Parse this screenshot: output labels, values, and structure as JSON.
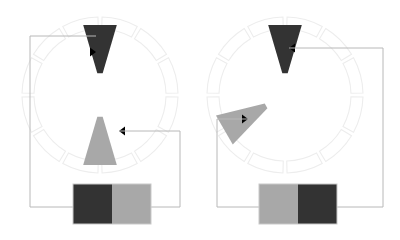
{
  "figure": {
    "background_color": "#ffffff",
    "width": 400,
    "height": 240,
    "colors": {
      "dark_pole": "#333333",
      "light_pole": "#a8a8a8",
      "wire": "#b8b8b8",
      "segment_outline": "#ededed",
      "arrow": "#000000",
      "box_outline": "#c9c9c9"
    }
  },
  "panels": [
    {
      "id": "left",
      "label": "left-panel",
      "stator": {
        "label": "stator-ring-left",
        "center_x": 100,
        "center_y": 95,
        "outer_radius": 78,
        "inner_radius": 66,
        "segment_count": 12,
        "segment_gap_degrees": 3
      },
      "poles": [
        {
          "id": "left-dark-pole",
          "color": "#333333",
          "angle_degrees": 90,
          "arrow_direction": "right",
          "arrow_x": 96,
          "arrow_y": 52
        },
        {
          "id": "left-light-pole",
          "color": "#a8a8a8",
          "angle_degrees": 270,
          "arrow_direction": "left",
          "arrow_x": 119,
          "arrow_y": 131
        }
      ],
      "source_box": {
        "label": "source-box-left",
        "x": 73,
        "y": 184,
        "width": 78,
        "height": 40,
        "left_half_color": "#333333",
        "right_half_color": "#a8a8a8"
      },
      "wires": [
        {
          "id": "left-wire-upper",
          "path": "M 73 207 L 30 207 L 30 36 L 96 36",
          "terminal": "dark-pole"
        },
        {
          "id": "left-wire-lower",
          "path": "M 151 207 L 180 207 L 180 131 L 119 131",
          "terminal": "light-pole"
        }
      ]
    },
    {
      "id": "right",
      "label": "right-panel",
      "stator": {
        "label": "stator-ring-right",
        "center_x": 285,
        "center_y": 95,
        "outer_radius": 78,
        "inner_radius": 66,
        "segment_count": 12,
        "segment_gap_degrees": 3
      },
      "poles": [
        {
          "id": "right-dark-pole",
          "color": "#333333",
          "angle_degrees": 90,
          "arrow_direction": "left",
          "arrow_x": 289,
          "arrow_y": 48
        },
        {
          "id": "right-light-pole",
          "color": "#a8a8a8",
          "angle_degrees": 210,
          "arrow_direction": "right",
          "arrow_x": 248,
          "arrow_y": 119
        }
      ],
      "source_box": {
        "label": "source-box-right",
        "x": 259,
        "y": 184,
        "width": 78,
        "height": 40,
        "left_half_color": "#a8a8a8",
        "right_half_color": "#333333"
      },
      "wires": [
        {
          "id": "right-wire-upper",
          "path": "M 337 207 L 383 207 L 383 48 L 289 48",
          "terminal": "dark-pole"
        },
        {
          "id": "right-wire-lower",
          "path": "M 259 207 L 217 207 L 217 119 L 248 119",
          "terminal": "light-pole"
        }
      ]
    }
  ]
}
